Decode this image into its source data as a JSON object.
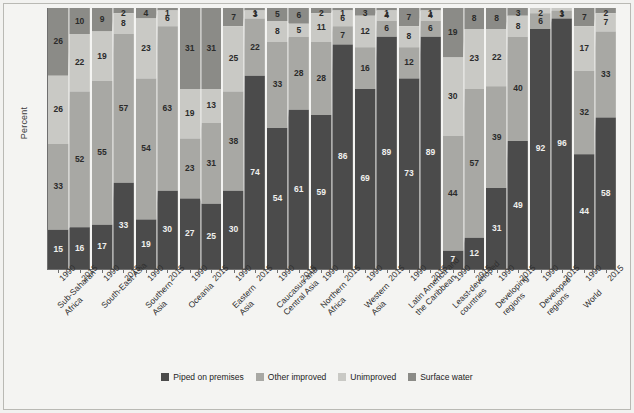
{
  "chart_data": {
    "type": "bar",
    "title": "",
    "subtitle": "",
    "xlabel": "",
    "ylabel": "Percent",
    "ylim": [
      0,
      100
    ],
    "grid": false,
    "stacked": true,
    "stacked_mode": "percent",
    "legend_position": "bottom",
    "series": [
      {
        "name": "Piped on premises",
        "color": "#4b4b4b"
      },
      {
        "name": "Other improved",
        "color": "#a8a8a4"
      },
      {
        "name": "Unimproved",
        "color": "#c9c9c5"
      },
      {
        "name": "Surface water",
        "color": "#8b8b87"
      }
    ],
    "categories": [
      "Sub-Saharan Africa",
      "South-East Asia",
      "Southern Asia",
      "Oceania",
      "Eastern Asia",
      "Caucasus and Central Asia",
      "Northern Africa",
      "Western Asia",
      "Latin America and the Caribbean",
      "Least-developed countries",
      "Developing regions",
      "Developed regions",
      "World"
    ],
    "years": [
      "1990",
      "2015"
    ],
    "groups": [
      {
        "category": "Sub-Saharan Africa",
        "label_lines": [
          "Sub-Saharan",
          "Africa"
        ],
        "bars": [
          {
            "year": "1990",
            "values": {
              "piped": 15,
              "other_improved": 33,
              "unimproved": 26,
              "surface_water": 26
            }
          },
          {
            "year": "2015",
            "values": {
              "piped": 16,
              "other_improved": 52,
              "unimproved": 22,
              "surface_water": 10
            }
          }
        ]
      },
      {
        "category": "South-East Asia",
        "label_lines": [
          "South-East Asia"
        ],
        "bars": [
          {
            "year": "1990",
            "values": {
              "piped": 17,
              "other_improved": 55,
              "unimproved": 19,
              "surface_water": 9
            }
          },
          {
            "year": "2015",
            "values": {
              "piped": 33,
              "other_improved": 57,
              "unimproved": 8,
              "surface_water": 2
            }
          }
        ]
      },
      {
        "category": "Southern Asia",
        "label_lines": [
          "Southern",
          "Asia"
        ],
        "bars": [
          {
            "year": "1990",
            "values": {
              "piped": 19,
              "other_improved": 54,
              "unimproved": 23,
              "surface_water": 4
            }
          },
          {
            "year": "2015",
            "values": {
              "piped": 30,
              "other_improved": 63,
              "unimproved": 6,
              "surface_water": 1
            }
          }
        ]
      },
      {
        "category": "Oceania",
        "label_lines": [
          "Oceania"
        ],
        "bars": [
          {
            "year": "1990",
            "values": {
              "piped": 27,
              "other_improved": 23,
              "unimproved": 19,
              "surface_water": 31
            }
          },
          {
            "year": "2015",
            "values": {
              "piped": 25,
              "other_improved": 31,
              "unimproved": 13,
              "surface_water": 31
            }
          }
        ]
      },
      {
        "category": "Eastern Asia",
        "label_lines": [
          "Eastern",
          "Asia"
        ],
        "bars": [
          {
            "year": "1990",
            "values": {
              "piped": 30,
              "other_improved": 38,
              "unimproved": 25,
              "surface_water": 7
            }
          },
          {
            "year": "2015",
            "values": {
              "piped": 74,
              "other_improved": 22,
              "unimproved": 3,
              "surface_water": 1
            }
          }
        ]
      },
      {
        "category": "Caucasus and Central Asia",
        "label_lines": [
          "Caucasus and",
          "Central Asia"
        ],
        "bars": [
          {
            "year": "1990",
            "values": {
              "piped": 54,
              "other_improved": 33,
              "unimproved": 8,
              "surface_water": 5
            }
          },
          {
            "year": "2015",
            "values": {
              "piped": 61,
              "other_improved": 28,
              "unimproved": 5,
              "surface_water": 6
            }
          }
        ]
      },
      {
        "category": "Northern Africa",
        "label_lines": [
          "Northern",
          "Africa"
        ],
        "bars": [
          {
            "year": "1990",
            "values": {
              "piped": 59,
              "other_improved": 28,
              "unimproved": 11,
              "surface_water": 2
            }
          },
          {
            "year": "2015",
            "values": {
              "piped": 86,
              "other_improved": 7,
              "unimproved": 6,
              "surface_water": 1
            }
          }
        ]
      },
      {
        "category": "Western Asia",
        "label_lines": [
          "Western",
          "Asia"
        ],
        "bars": [
          {
            "year": "1990",
            "values": {
              "piped": 69,
              "other_improved": 16,
              "unimproved": 12,
              "surface_water": 3
            }
          },
          {
            "year": "2015",
            "values": {
              "piped": 89,
              "other_improved": 6,
              "unimproved": 4,
              "surface_water": 1
            }
          }
        ]
      },
      {
        "category": "Latin America and the Caribbean",
        "label_lines": [
          "Latin America and",
          "the Caribbean"
        ],
        "bars": [
          {
            "year": "1990",
            "values": {
              "piped": 73,
              "other_improved": 12,
              "unimproved": 8,
              "surface_water": 7
            }
          },
          {
            "year": "2015",
            "values": {
              "piped": 89,
              "other_improved": 6,
              "unimproved": 4,
              "surface_water": 1
            }
          }
        ]
      },
      {
        "category": "Least-developed countries",
        "label_lines": [
          "Least-developed",
          "countries"
        ],
        "bars": [
          {
            "year": "1990",
            "values": {
              "piped": 7,
              "other_improved": 44,
              "unimproved": 30,
              "surface_water": 19
            }
          },
          {
            "year": "2015",
            "values": {
              "piped": 12,
              "other_improved": 57,
              "unimproved": 23,
              "surface_water": 8
            }
          }
        ]
      },
      {
        "category": "Developing regions",
        "label_lines": [
          "Developing",
          "regions"
        ],
        "bars": [
          {
            "year": "1990",
            "values": {
              "piped": 31,
              "other_improved": 39,
              "unimproved": 22,
              "surface_water": 8
            }
          },
          {
            "year": "2015",
            "values": {
              "piped": 49,
              "other_improved": 40,
              "unimproved": 8,
              "surface_water": 3
            }
          }
        ]
      },
      {
        "category": "Developed regions",
        "label_lines": [
          "Developed",
          "regions"
        ],
        "bars": [
          {
            "year": "1990",
            "values": {
              "piped": 92,
              "other_improved": 6,
              "unimproved": 2,
              "surface_water": 0
            }
          },
          {
            "year": "2015",
            "values": {
              "piped": 96,
              "other_improved": 3,
              "unimproved": 1,
              "surface_water": 0
            }
          }
        ]
      },
      {
        "category": "World",
        "label_lines": [
          "World"
        ],
        "bars": [
          {
            "year": "1990",
            "values": {
              "piped": 44,
              "other_improved": 32,
              "unimproved": 17,
              "surface_water": 7
            }
          },
          {
            "year": "2015",
            "values": {
              "piped": 58,
              "other_improved": 33,
              "unimproved": 7,
              "surface_water": 2
            }
          }
        ]
      }
    ]
  },
  "axis": {
    "ylabel": "Percent"
  },
  "legend": {
    "items": [
      {
        "label": "Piped on premises",
        "color": "#4b4b4b"
      },
      {
        "label": "Other improved",
        "color": "#a8a8a4"
      },
      {
        "label": "Unimproved",
        "color": "#c9c9c5"
      },
      {
        "label": "Surface water",
        "color": "#8b8b87"
      }
    ]
  }
}
